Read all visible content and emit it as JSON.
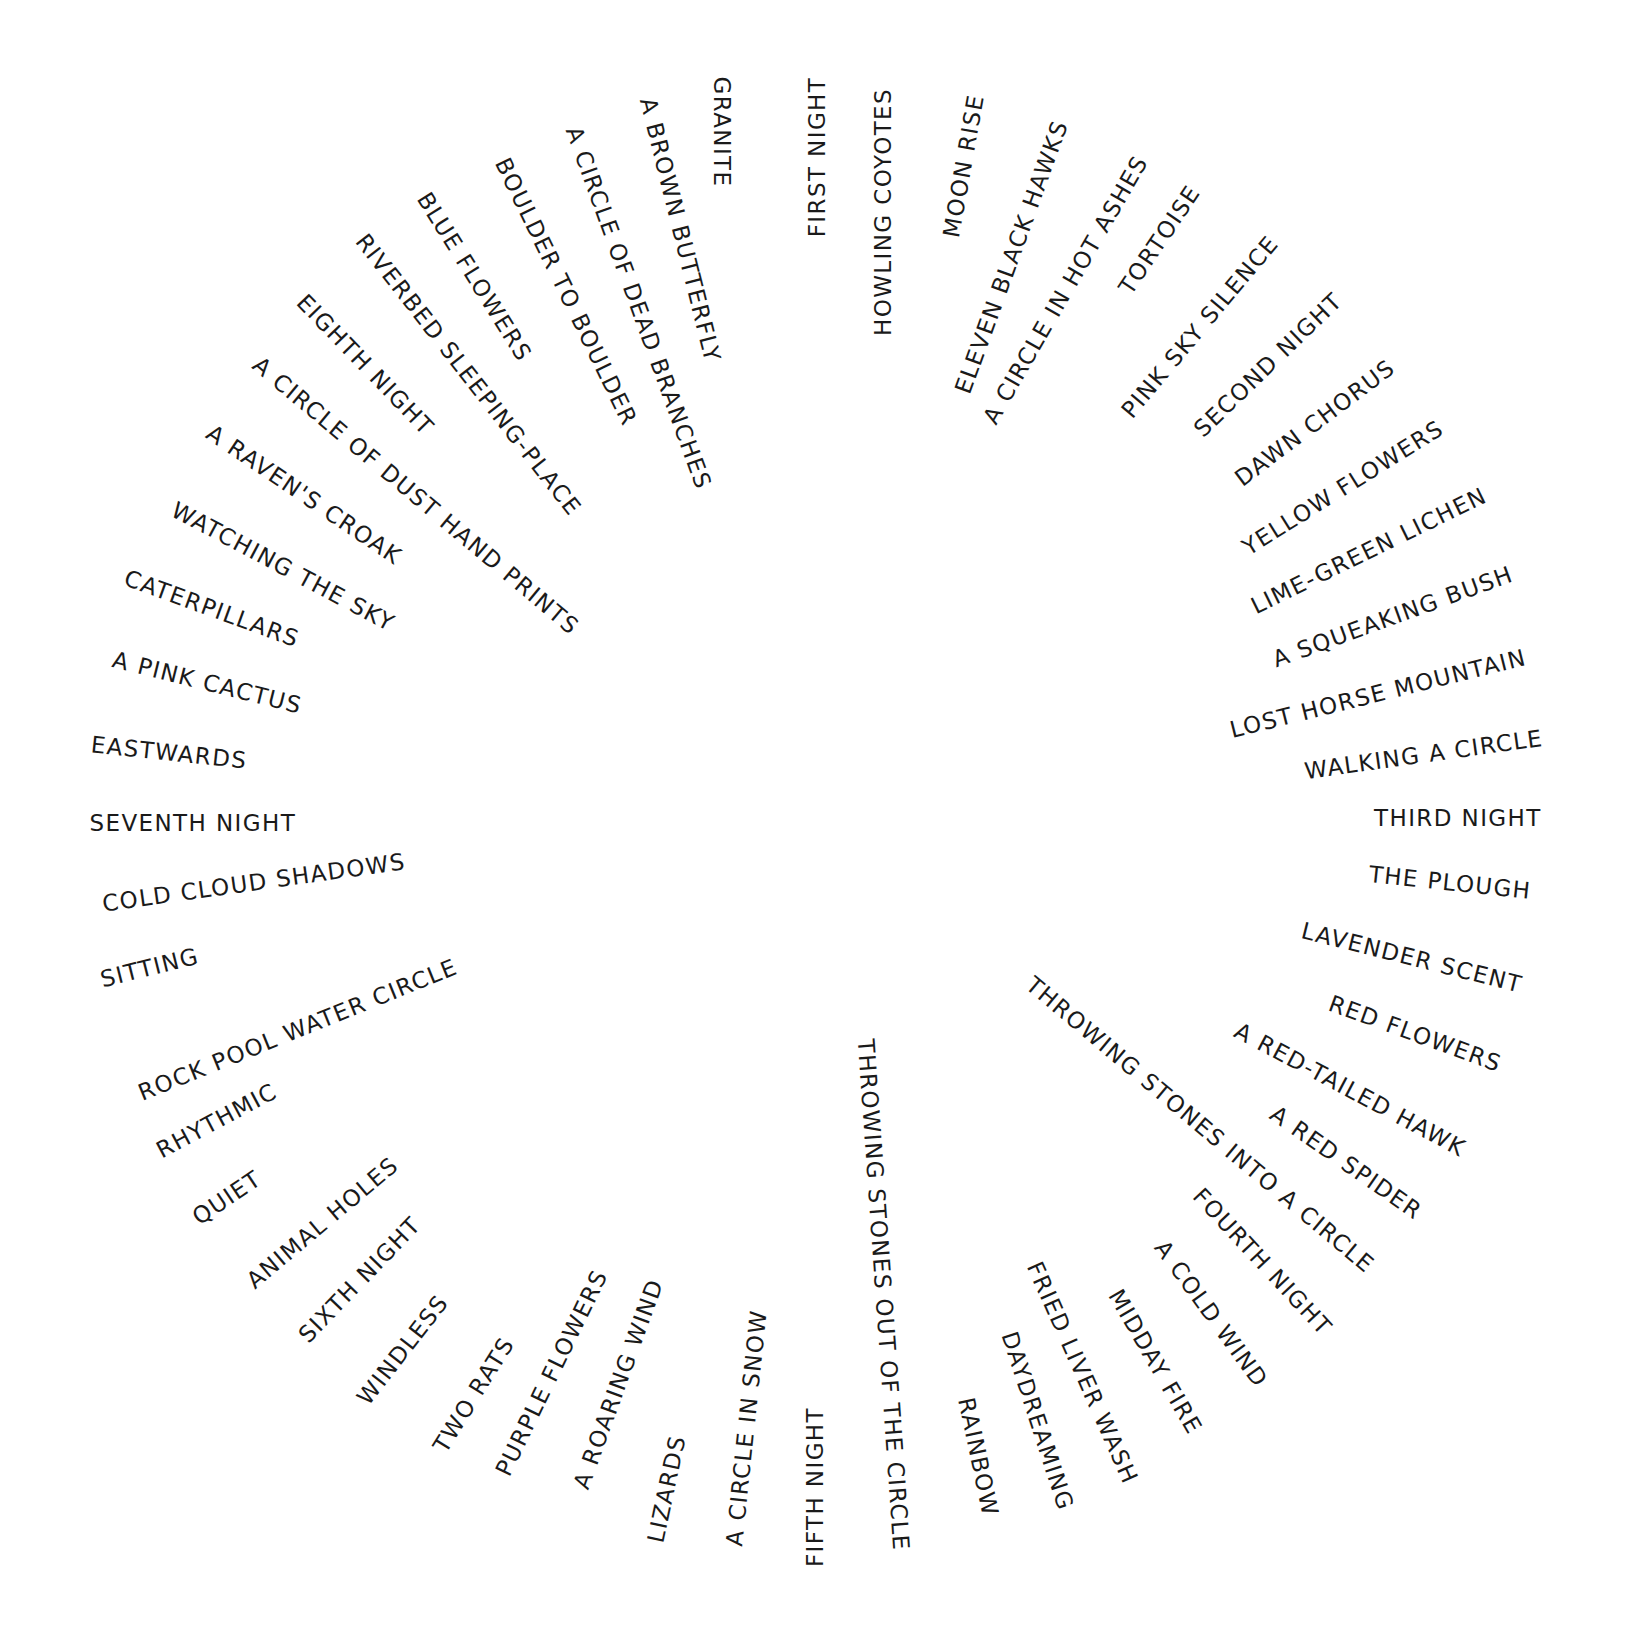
{
  "artwork": {
    "layout": "radial-circle",
    "text_color": "#1a1a1a",
    "background": "#ffffff",
    "phrases": [
      {
        "text": "GRANITE",
        "x": 722,
        "y": 132,
        "rot": 90
      },
      {
        "text": "FIRST NIGHT",
        "x": 818,
        "y": 157,
        "rot": -90
      },
      {
        "text": "HOWLING COYOTES",
        "x": 883,
        "y": 212,
        "rot": -90
      },
      {
        "text": "MOON RISE",
        "x": 964,
        "y": 166,
        "rot": -80
      },
      {
        "text": "ELEVEN BLACK HAWKS",
        "x": 1012,
        "y": 257,
        "rot": -70
      },
      {
        "text": "A CIRCLE IN HOT ASHES",
        "x": 1066,
        "y": 290,
        "rot": -60
      },
      {
        "text": "TORTOISE",
        "x": 1160,
        "y": 240,
        "rot": -56
      },
      {
        "text": "PINK SKY SILENCE",
        "x": 1200,
        "y": 327,
        "rot": -50
      },
      {
        "text": "SECOND NIGHT",
        "x": 1268,
        "y": 365,
        "rot": -44
      },
      {
        "text": "DAWN CHORUS",
        "x": 1315,
        "y": 423,
        "rot": -37
      },
      {
        "text": "YELLOW FLOWERS",
        "x": 1343,
        "y": 488,
        "rot": -32
      },
      {
        "text": "LIME-GREEN LICHEN",
        "x": 1369,
        "y": 551,
        "rot": -26
      },
      {
        "text": "A SQUEAKING BUSH",
        "x": 1393,
        "y": 617,
        "rot": -20
      },
      {
        "text": "LOST HORSE MOUNTAIN",
        "x": 1378,
        "y": 694,
        "rot": -14
      },
      {
        "text": "WALKING A CIRCLE",
        "x": 1424,
        "y": 755,
        "rot": -8
      },
      {
        "text": "THIRD NIGHT",
        "x": 1458,
        "y": 818,
        "rot": 0
      },
      {
        "text": "THE PLOUGH",
        "x": 1450,
        "y": 883,
        "rot": 6
      },
      {
        "text": "LAVENDER SCENT",
        "x": 1412,
        "y": 958,
        "rot": 14
      },
      {
        "text": "RED FLOWERS",
        "x": 1415,
        "y": 1034,
        "rot": 20
      },
      {
        "text": "A RED-TAILED HAWK",
        "x": 1350,
        "y": 1090,
        "rot": 28
      },
      {
        "text": "A RED SPIDER",
        "x": 1346,
        "y": 1163,
        "rot": 35
      },
      {
        "text": "THROWING STONES INTO A CIRCLE",
        "x": 1200,
        "y": 1125,
        "rot": 40
      },
      {
        "text": "FOURTH NIGHT",
        "x": 1262,
        "y": 1262,
        "rot": 47
      },
      {
        "text": "A COLD WIND",
        "x": 1211,
        "y": 1314,
        "rot": 54
      },
      {
        "text": "MIDDAY FIRE",
        "x": 1155,
        "y": 1362,
        "rot": 60
      },
      {
        "text": "FRIED LIVER WASH",
        "x": 1082,
        "y": 1373,
        "rot": 66
      },
      {
        "text": "DAYDREAMING",
        "x": 1037,
        "y": 1421,
        "rot": 72
      },
      {
        "text": "RAINBOW",
        "x": 978,
        "y": 1457,
        "rot": 78
      },
      {
        "text": "THROWING STONES OUT OF THE CIRCLE",
        "x": 883,
        "y": 1295,
        "rot": 86
      },
      {
        "text": "FIFTH NIGHT",
        "x": 815,
        "y": 1487,
        "rot": -90
      },
      {
        "text": "A CIRCLE IN SNOW",
        "x": 747,
        "y": 1428,
        "rot": -84
      },
      {
        "text": "LIZARDS",
        "x": 667,
        "y": 1489,
        "rot": -78
      },
      {
        "text": "A ROARING WIND",
        "x": 619,
        "y": 1384,
        "rot": -70
      },
      {
        "text": "PURPLE FLOWERS",
        "x": 552,
        "y": 1373,
        "rot": -64
      },
      {
        "text": "TWO RATS",
        "x": 474,
        "y": 1395,
        "rot": -58
      },
      {
        "text": "WINDLESS",
        "x": 403,
        "y": 1350,
        "rot": -52
      },
      {
        "text": "SIXTH NIGHT",
        "x": 360,
        "y": 1280,
        "rot": -46
      },
      {
        "text": "ANIMAL HOLES",
        "x": 323,
        "y": 1223,
        "rot": -40
      },
      {
        "text": "QUIET",
        "x": 227,
        "y": 1198,
        "rot": -34
      },
      {
        "text": "RHYTHMIC",
        "x": 217,
        "y": 1121,
        "rot": -28
      },
      {
        "text": "ROCK POOL WATER CIRCLE",
        "x": 298,
        "y": 1030,
        "rot": -22
      },
      {
        "text": "SITTING",
        "x": 150,
        "y": 968,
        "rot": -14
      },
      {
        "text": "COLD CLOUD SHADOWS",
        "x": 254,
        "y": 883,
        "rot": -8
      },
      {
        "text": "SEVENTH NIGHT",
        "x": 193,
        "y": 823,
        "rot": 0
      },
      {
        "text": "EASTWARDS",
        "x": 169,
        "y": 753,
        "rot": 6
      },
      {
        "text": "A PINK CACTUS",
        "x": 207,
        "y": 683,
        "rot": 14
      },
      {
        "text": "CATERPILLARS",
        "x": 212,
        "y": 609,
        "rot": 20
      },
      {
        "text": "WATCHING THE SKY",
        "x": 283,
        "y": 567,
        "rot": 28
      },
      {
        "text": "A RAVEN'S CROAK",
        "x": 304,
        "y": 495,
        "rot": 34
      },
      {
        "text": "A CIRCLE OF DUST HAND PRINTS",
        "x": 416,
        "y": 496,
        "rot": 40
      },
      {
        "text": "EIGHTH NIGHT",
        "x": 365,
        "y": 365,
        "rot": 46
      },
      {
        "text": "RIVERBED SLEEPING-PLACE",
        "x": 468,
        "y": 375,
        "rot": 52
      },
      {
        "text": "BLUE FLOWERS",
        "x": 474,
        "y": 277,
        "rot": 58
      },
      {
        "text": "BOULDER TO BOULDER",
        "x": 566,
        "y": 292,
        "rot": 64
      },
      {
        "text": "A CIRCLE OF DEAD BRANCHES",
        "x": 638,
        "y": 308,
        "rot": 70
      },
      {
        "text": "A BROWN BUTTERFLY",
        "x": 680,
        "y": 230,
        "rot": 76
      }
    ]
  }
}
